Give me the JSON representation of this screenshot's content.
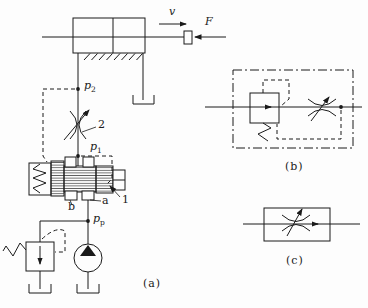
{
  "figure": {
    "captions": {
      "a": "(a)",
      "b": "(b)",
      "c": "(c)"
    },
    "labels": {
      "velocity": "v",
      "force": "F",
      "p2": {
        "base": "p",
        "sub": "2"
      },
      "p1": {
        "base": "p",
        "sub": "1"
      },
      "pp": {
        "base": "p",
        "sub": "p"
      },
      "throttle_number": "2",
      "valve_number": "1",
      "port_b": "b",
      "port_a": "a"
    },
    "colors": {
      "line": "#1a1a1a",
      "background": "#fdfdfd"
    }
  }
}
